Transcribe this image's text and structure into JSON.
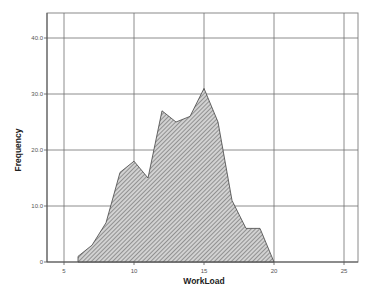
{
  "chart_data": {
    "type": "area",
    "title": "",
    "xlabel": "WorkLoad",
    "ylabel": "Frequency",
    "x": [
      6,
      7,
      8,
      9,
      10,
      11,
      12,
      13,
      14,
      15,
      16,
      17,
      18,
      19,
      20
    ],
    "values": [
      1,
      3,
      7,
      16,
      18,
      15,
      27,
      25,
      26,
      31,
      25,
      11,
      6,
      6,
      0
    ],
    "xlim": [
      3.8,
      26
    ],
    "ylim": [
      0,
      44.5
    ],
    "xticks": [
      5,
      10,
      15,
      20,
      25
    ],
    "xtick_labels": [
      "5",
      "10",
      "15",
      "20",
      "25"
    ],
    "yticks": [
      0,
      10,
      20,
      30,
      40
    ],
    "ytick_labels": [
      "0",
      "10.0",
      "20.0",
      "30.0",
      "40.0"
    ],
    "grid": true,
    "legend": null,
    "fill": "diagonal-hatch",
    "colors": {
      "fill": "#b9b9b9",
      "hatch": "#6e6e6e",
      "grid": "#707070",
      "outline": "#444444"
    }
  }
}
